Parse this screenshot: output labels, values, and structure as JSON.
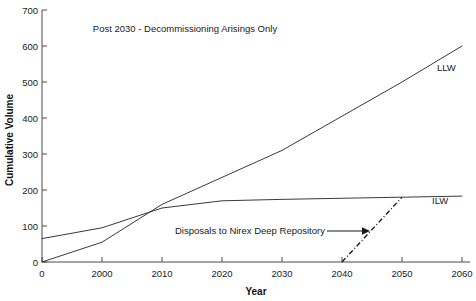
{
  "chart_data": {
    "type": "line",
    "title": "Post 2030 - Decommissioning Arisings Only",
    "xlabel": "Year",
    "ylabel": "Cumulative Volume",
    "xticklabels": [
      "0",
      "2000",
      "2010",
      "2020",
      "2030",
      "2040",
      "2050",
      "2060"
    ],
    "yticklabels": [
      "0",
      "100",
      "200",
      "300",
      "400",
      "500",
      "600",
      "700"
    ],
    "ylim": [
      0,
      700
    ],
    "yticks": [
      0,
      100,
      200,
      300,
      400,
      500,
      600,
      700
    ],
    "grid": false,
    "legend_position": "inline-right-of-series",
    "series": [
      {
        "name": "LLW",
        "label": "LLW",
        "style": "solid",
        "x": [
          "0",
          "2000",
          "2010",
          "2020",
          "2030",
          "2040",
          "2050",
          "2060"
        ],
        "values": [
          0,
          55,
          160,
          235,
          310,
          405,
          500,
          600
        ]
      },
      {
        "name": "ILW",
        "label": "ILW",
        "style": "solid",
        "x": [
          "0",
          "2000",
          "2010",
          "2020",
          "2030",
          "2040",
          "2050",
          "2060"
        ],
        "values": [
          65,
          95,
          150,
          170,
          174,
          177,
          180,
          183
        ]
      },
      {
        "name": "Disposals to Nirex Deep Repository",
        "label": "",
        "style": "dash-dot",
        "x": [
          "2040",
          "2050"
        ],
        "values": [
          0,
          180
        ]
      }
    ],
    "annotations": [
      {
        "text": "Disposals to Nirex Deep Repository",
        "arrow": "right",
        "points_to": "2040"
      }
    ]
  },
  "axis": {
    "y_title": "Cumulative Volume",
    "x_title": "Year"
  },
  "colors": {
    "background": "#ffffff",
    "line": "#3a3a3a",
    "axis": "#4a4a4a",
    "text": "#1a1a1a"
  }
}
